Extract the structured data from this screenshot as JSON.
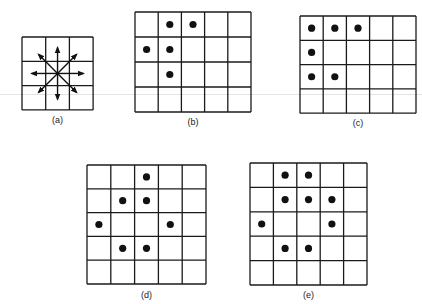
{
  "figure": {
    "panels": [
      {
        "id": "a",
        "label": "(a)",
        "cols": 3,
        "rows": 3,
        "x": 22,
        "y": 37,
        "cell_w": 23.7,
        "cell_h": 24.3,
        "label_y": 115,
        "arrows": [
          "N",
          "NE",
          "E",
          "SE",
          "S",
          "SW",
          "W",
          "NW"
        ],
        "dots": []
      },
      {
        "id": "b",
        "label": "(b)",
        "cols": 5,
        "rows": 4,
        "x": 135,
        "y": 12,
        "cell_w": 23.2,
        "cell_h": 25,
        "label_y": 117,
        "dots": [
          [
            0,
            1
          ],
          [
            0,
            2
          ],
          [
            1,
            0
          ],
          [
            1,
            1
          ],
          [
            2,
            1
          ]
        ]
      },
      {
        "id": "c",
        "label": "(c)",
        "cols": 5,
        "rows": 4,
        "x": 300,
        "y": 16,
        "cell_w": 23.2,
        "cell_h": 24.3,
        "label_y": 118,
        "dots": [
          [
            0,
            0
          ],
          [
            0,
            1
          ],
          [
            0,
            2
          ],
          [
            1,
            0
          ],
          [
            2,
            0
          ],
          [
            2,
            1
          ]
        ]
      },
      {
        "id": "d",
        "label": "(d)",
        "cols": 5,
        "rows": 5,
        "x": 87,
        "y": 165,
        "cell_w": 23.8,
        "cell_h": 23.8,
        "label_y": 290,
        "dots": [
          [
            0,
            2
          ],
          [
            1,
            1
          ],
          [
            1,
            2
          ],
          [
            2,
            0
          ],
          [
            2,
            3
          ],
          [
            3,
            1
          ],
          [
            3,
            2
          ]
        ]
      },
      {
        "id": "e",
        "label": "(e)",
        "cols": 5,
        "rows": 5,
        "x": 250,
        "y": 163,
        "cell_w": 23.4,
        "cell_h": 24.4,
        "label_y": 290,
        "dots": [
          [
            0,
            1
          ],
          [
            0,
            2
          ],
          [
            1,
            1
          ],
          [
            1,
            2
          ],
          [
            1,
            3
          ],
          [
            2,
            0
          ],
          [
            2,
            3
          ],
          [
            3,
            1
          ],
          [
            3,
            2
          ]
        ]
      }
    ]
  }
}
